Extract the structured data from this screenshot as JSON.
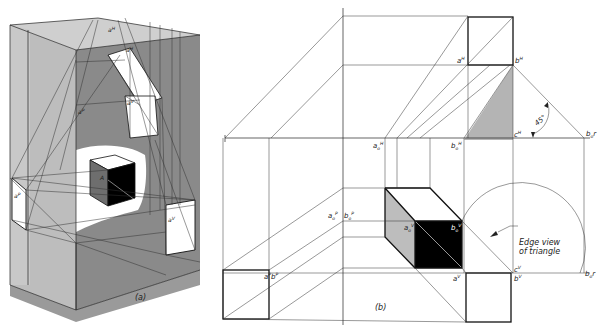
{
  "figure_a": {
    "caption": "(a)",
    "labels": {
      "a_h": "a",
      "a_h_sup": "H",
      "a_o_h": "a",
      "a_o_h_sub": "o",
      "a_o_h_sup": "H",
      "a_o_v": "a",
      "a_o_v_sub": "o",
      "a_o_v_sup": "V",
      "a_o_p": "a",
      "a_o_p_sub": "o",
      "a_o_p_sup": "P",
      "a_p": "a",
      "a_p_sup": "P",
      "a_v": "a",
      "a_v_sup": "V",
      "A": "A"
    },
    "colors": {
      "light_gray": "#b9b9b9",
      "mid_gray": "#8f8f8f",
      "dark_gray": "#7a7a7a",
      "white": "#ffffff",
      "black": "#000000"
    }
  },
  "figure_b": {
    "caption": "(b)",
    "labels": {
      "a_h": "a",
      "a_h_sup": "H",
      "b_h": "b",
      "b_h_sup": "H",
      "c_h": "c",
      "c_h_sup": "H",
      "b_o_r_h": "b",
      "b_o_r_h_sub": "o",
      "b_o_r_h_r": "r",
      "b_o_r_h_sup": "H",
      "a_o_h": "a",
      "a_o_h_sub": "o",
      "a_o_h_sup": "H",
      "b_o_h": "b",
      "b_o_h_sub": "o",
      "b_o_h_sup": "H",
      "a_o_p": "a",
      "a_o_p_sub": "o",
      "a_o_p_sup": "P",
      "b_o_p": "b",
      "b_o_p_sub": "o",
      "b_o_p_sup": "P",
      "a_o_v": "a",
      "a_o_v_sub": "o",
      "a_o_v_sup": "V",
      "b_o_v": "b",
      "b_o_v_sub": "o",
      "b_o_v_sup": "V",
      "a_p": "a",
      "a_p_sup": "P",
      "b_p": "b",
      "b_p_sup": "P",
      "a_v": "a",
      "a_v_sup": "V",
      "c_v": "c",
      "c_v_sup": "V",
      "b_v": "b",
      "b_v_sup": "V",
      "b_o_r_v": "b",
      "b_o_r_v_sub": "o",
      "b_o_r_v_r": "r",
      "b_o_r_v_sup": "V"
    },
    "angle_label": "45°",
    "note_line1": "Edge view",
    "note_line2": "of triangle",
    "colors": {
      "triangle_fill": "#b4b4b4",
      "cube_side": "#bdbdbd",
      "cube_front": "#000000"
    }
  }
}
